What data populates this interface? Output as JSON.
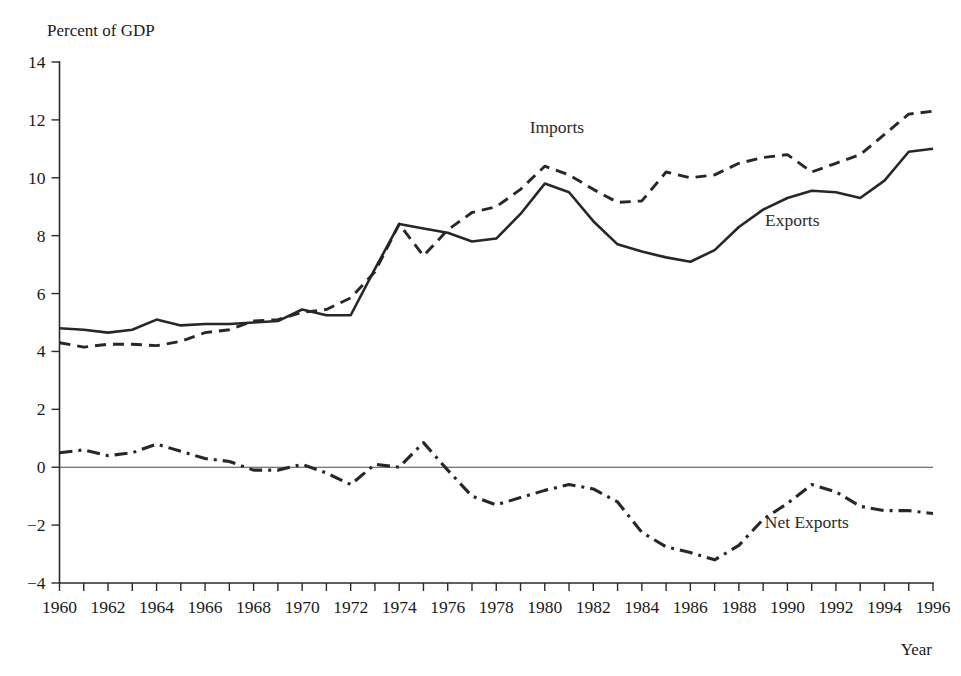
{
  "chart_data": {
    "type": "line",
    "title": "",
    "ylabel": "Percent of GDP",
    "xlabel": "Year",
    "ylim": [
      -4,
      14
    ],
    "xlim": [
      1960,
      1996
    ],
    "ytick_step": 2,
    "xtick_step": 1,
    "xlabel_step": 2,
    "grid": false,
    "legend_position": "inline-annotations",
    "zero_line": true,
    "ytick_labels": [
      "14",
      "12",
      "10",
      "8",
      "6",
      "4",
      "2",
      "0",
      "−2",
      "−4"
    ],
    "ytick_values": [
      14,
      12,
      10,
      8,
      6,
      4,
      2,
      0,
      -2,
      -4
    ],
    "xtick_labels": [
      "1960",
      "1962",
      "1964",
      "1966",
      "1968",
      "1970",
      "1972",
      "1974",
      "1976",
      "1978",
      "1980",
      "1982",
      "1984",
      "1986",
      "1988",
      "1990",
      "1992",
      "1994",
      "1996"
    ],
    "x": [
      1960,
      1961,
      1962,
      1963,
      1964,
      1965,
      1966,
      1967,
      1968,
      1969,
      1970,
      1971,
      1972,
      1973,
      1974,
      1975,
      1976,
      1977,
      1978,
      1979,
      1980,
      1981,
      1982,
      1983,
      1984,
      1985,
      1986,
      1987,
      1988,
      1989,
      1990,
      1991,
      1992,
      1993,
      1994,
      1995,
      1996
    ],
    "series": [
      {
        "name": "Exports",
        "style": "solid",
        "color": "#272727",
        "label_x": 1990.2,
        "label_y": 8.35,
        "values": [
          4.8,
          4.75,
          4.65,
          4.75,
          5.1,
          4.9,
          4.95,
          4.95,
          5.0,
          5.05,
          5.45,
          5.25,
          5.25,
          6.85,
          8.4,
          8.25,
          8.1,
          7.8,
          7.9,
          8.75,
          9.8,
          9.5,
          8.5,
          7.7,
          7.45,
          7.25,
          7.1,
          7.5,
          8.3,
          8.9,
          9.3,
          9.55,
          9.5,
          9.3,
          9.9,
          10.9,
          11.0
        ]
      },
      {
        "name": "Imports",
        "style": "dashed",
        "color": "#272727",
        "label_x": 1980.5,
        "label_y": 11.55,
        "values": [
          4.3,
          4.15,
          4.25,
          4.25,
          4.2,
          4.35,
          4.65,
          4.75,
          5.05,
          5.1,
          5.35,
          5.45,
          5.85,
          6.75,
          8.4,
          7.3,
          8.2,
          8.8,
          9.0,
          9.6,
          10.4,
          10.1,
          9.6,
          9.15,
          9.2,
          10.2,
          10.0,
          10.1,
          10.5,
          10.7,
          10.8,
          10.2,
          10.5,
          10.8,
          11.5,
          12.2,
          12.3
        ]
      },
      {
        "name": "Net Exports",
        "style": "dashdot",
        "color": "#272727",
        "label_x": 1990.8,
        "label_y": -2.1,
        "values": [
          0.5,
          0.6,
          0.4,
          0.5,
          0.8,
          0.55,
          0.3,
          0.2,
          -0.1,
          -0.1,
          0.1,
          -0.2,
          -0.6,
          0.1,
          0.0,
          0.85,
          -0.1,
          -1.0,
          -1.3,
          -1.05,
          -0.8,
          -0.6,
          -0.75,
          -1.2,
          -2.25,
          -2.75,
          -2.95,
          -3.2,
          -2.7,
          -1.8,
          -1.25,
          -0.6,
          -0.85,
          -1.35,
          -1.5,
          -1.5,
          -1.6
        ]
      }
    ]
  }
}
